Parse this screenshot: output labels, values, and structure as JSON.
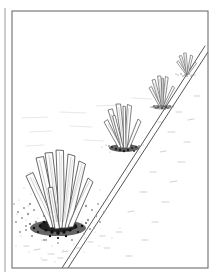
{
  "figure": {
    "domain": "Natural-Image",
    "medium": "pen-and-ink line drawing",
    "subject": "four agave-like plants in receding perspective beside a diagonal path edge",
    "background_color": "#ffffff",
    "ink_color": "#3a3a3a",
    "soil_dark_color": "#262626",
    "blade_fill_color": "#fdfdfd",
    "faint_ground_color": "#c9c9c9"
  },
  "page_edge": {
    "name": "page-edge-rule",
    "x": 5,
    "y_top": 8,
    "y_bottom": 272,
    "color": "#9a9a9a",
    "width": 1
  },
  "frame": {
    "name": "illustration-border",
    "x": 12,
    "y": 11,
    "width": 196,
    "height": 257,
    "stroke": "#6e6e6e",
    "stroke_width": 1.1
  },
  "path_edge": {
    "name": "diagonal-path-edge",
    "description": "double parallel line running from upper right to lower left, a road or trail margin",
    "line_a": {
      "x1": 205,
      "y1": 46,
      "x2": 62,
      "y2": 268
    },
    "line_b": {
      "x1": 208,
      "y1": 52,
      "x2": 68,
      "y2": 268
    },
    "stroke": "#555555",
    "stroke_width": 1.0
  },
  "plants": [
    {
      "id": "plant-foreground",
      "label": "Foreground agave",
      "order": 1,
      "scale": "largest",
      "center_x": 58,
      "base_y": 224,
      "height": 74,
      "blade_count": 8,
      "has_soil_mound": true,
      "soil_spread": 52
    },
    {
      "id": "plant-midground",
      "label": "Midground agave",
      "order": 2,
      "scale": "medium",
      "center_x": 124,
      "base_y": 147,
      "height": 42,
      "blade_count": 7,
      "has_soil_mound": true,
      "soil_spread": 28
    },
    {
      "id": "plant-background",
      "label": "Background agave",
      "order": 3,
      "scale": "small",
      "center_x": 162,
      "base_y": 106,
      "height": 30,
      "blade_count": 6,
      "has_soil_mound": true,
      "soil_spread": 19
    },
    {
      "id": "plant-distant",
      "label": "Distant agave",
      "order": 4,
      "scale": "smallest",
      "center_x": 186,
      "base_y": 73,
      "height": 20,
      "blade_count": 5,
      "has_soil_mound": true,
      "soil_spread": 13
    }
  ],
  "ground": {
    "name": "desert-ground-plane",
    "texture": "sparse stipple and short broken horizontal strokes",
    "left_of_path": "scattered pebble clusters",
    "right_of_path": "very faint sparse marks"
  }
}
